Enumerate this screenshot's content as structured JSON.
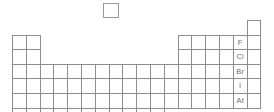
{
  "diagram": {
    "kind": "periodic-table-outline",
    "grid": {
      "columns": 18,
      "rows": 7,
      "origin_x": 12,
      "origin_y": 20,
      "cell_width": 13.8,
      "cell_height": 14.6,
      "line_color": "#8d8d8d",
      "background_color": "#ffffff",
      "label_color": "#6e6e6e"
    },
    "isolated_cell": {
      "name": "hydrogen-cell",
      "label": "",
      "x": 103,
      "y": 3,
      "width": 16,
      "height": 15
    },
    "blocks": [
      {
        "name": "s-block",
        "col_start": 1,
        "col_end": 2,
        "row_start": 2,
        "row_end": 7
      },
      {
        "name": "d-block",
        "col_start": 3,
        "col_end": 12,
        "row_start": 4,
        "row_end": 6
      },
      {
        "name": "d-block-row7",
        "col_start": 3,
        "col_end": 11,
        "row_start": 7,
        "row_end": 7
      },
      {
        "name": "p-block",
        "col_start": 13,
        "col_end": 18,
        "row_start": 2,
        "row_end": 6
      },
      {
        "name": "noble-gas-row1",
        "col_start": 18,
        "col_end": 18,
        "row_start": 1,
        "row_end": 1
      }
    ],
    "labeled_cells": [
      {
        "name": "element-cell-fluorine",
        "symbol": "F",
        "column": 17,
        "row": 2
      },
      {
        "name": "element-cell-chlorine",
        "symbol": "Cl",
        "column": 17,
        "row": 3
      },
      {
        "name": "element-cell-bromine",
        "symbol": "Br",
        "column": 17,
        "row": 4
      },
      {
        "name": "element-cell-iodine",
        "symbol": "I",
        "column": 17,
        "row": 5
      },
      {
        "name": "element-cell-astatine",
        "symbol": "At",
        "column": 17,
        "row": 6
      }
    ]
  }
}
